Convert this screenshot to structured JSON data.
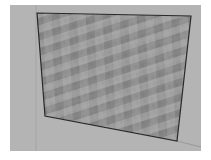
{
  "image": {
    "description": "Grayscale 3D render of a box/wall with a perspective-distorted mosaic checker texture on its front face",
    "background_color": "#ffffff",
    "box_color": "#b4b4b4",
    "face_base_color": "#9a9a9a",
    "tile_colors": [
      "#6e6e6e",
      "#828282",
      "#9a9a9a",
      "#a8a8a8",
      "#8c8c8c"
    ],
    "edge_color": "#2a2a2a"
  }
}
